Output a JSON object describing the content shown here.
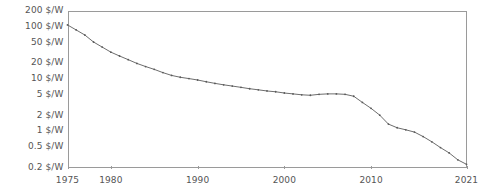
{
  "chart_data": {
    "type": "line",
    "title": "",
    "subtitle": "",
    "xlabel": "",
    "ylabel": "",
    "yscale": "log",
    "xscale": "linear",
    "grid": false,
    "legend": false,
    "legend_position": "none",
    "xlim": [
      1975,
      2021
    ],
    "ylim": [
      0.2,
      200
    ],
    "x_tick_labels": [
      "1975",
      "1980",
      "1990",
      "2000",
      "2010",
      "2021"
    ],
    "x_ticks": [
      1975,
      1980,
      1990,
      2000,
      2010,
      2021
    ],
    "y_tick_labels": [
      "200 $/W",
      "100 $/W",
      "50 $/W",
      "20 $/W",
      "10 $/W",
      "5 $/W",
      "2 $/W",
      "1 $/W",
      "0.5 $/W",
      "0.2 $/W"
    ],
    "y_ticks": [
      200,
      100,
      50,
      20,
      10,
      5,
      2,
      1,
      0.5,
      0.2
    ],
    "unit": "$/W",
    "series": [
      {
        "name": "Solar photovoltaic module price",
        "color": "#6d6d6d",
        "marker": "dot",
        "x": [
          1975,
          1976,
          1977,
          1978,
          1979,
          1980,
          1981,
          1982,
          1983,
          1984,
          1985,
          1986,
          1987,
          1988,
          1989,
          1990,
          1991,
          1992,
          1993,
          1994,
          1995,
          1996,
          1997,
          1998,
          1999,
          2000,
          2001,
          2002,
          2003,
          2004,
          2005,
          2006,
          2007,
          2008,
          2009,
          2010,
          2011,
          2012,
          2013,
          2014,
          2015,
          2016,
          2017,
          2018,
          2019,
          2020,
          2021
        ],
        "y": [
          106.0,
          85.0,
          68.0,
          50.0,
          40.0,
          32.0,
          27.0,
          23.0,
          19.5,
          17.0,
          15.0,
          13.0,
          11.5,
          10.6,
          10.0,
          9.4,
          8.7,
          8.1,
          7.6,
          7.2,
          6.8,
          6.4,
          6.1,
          5.8,
          5.6,
          5.3,
          5.1,
          4.9,
          4.8,
          5.0,
          5.1,
          5.1,
          5.0,
          4.6,
          3.5,
          2.7,
          2.0,
          1.35,
          1.15,
          1.05,
          0.95,
          0.78,
          0.62,
          0.48,
          0.38,
          0.28,
          0.23
        ]
      }
    ]
  },
  "axes": {
    "y_axis_name": "price-axis",
    "x_axis_name": "year-axis"
  },
  "colors": {
    "line": "#6d6d6d",
    "marker": "#5a5a5a",
    "frame": "#9a9a9a",
    "text": "#555555",
    "background": "#ffffff"
  }
}
